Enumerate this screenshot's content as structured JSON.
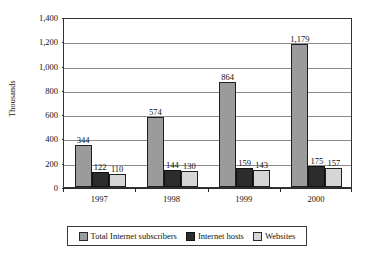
{
  "chart_data": {
    "type": "bar",
    "title": "",
    "subtitle": "",
    "xlabel": "",
    "ylabel": "Thousands",
    "categories": [
      "1997",
      "1998",
      "1999",
      "2000"
    ],
    "series": [
      {
        "name": "Total Internet subscribers",
        "color": "#9b9b9b",
        "values": [
          344,
          574,
          864,
          1179
        ]
      },
      {
        "name": "Internet hosts",
        "color": "#2c2c2c",
        "values": [
          122,
          144,
          159,
          175
        ]
      },
      {
        "name": "Websites",
        "color": "#d6d6d6",
        "values": [
          110,
          130,
          143,
          157
        ]
      }
    ],
    "ylim": [
      0,
      1400
    ],
    "ytick_values": [
      0,
      200,
      400,
      600,
      800,
      1000,
      1200,
      1400
    ],
    "ytick_labels": [
      "0",
      "200",
      "400",
      "600",
      "800",
      "1,000",
      "1,200",
      "1,400"
    ],
    "grid": "horizontal",
    "legend_position": "bottom",
    "data_labels": [
      [
        "344",
        "122",
        "110"
      ],
      [
        "574",
        "144",
        "130"
      ],
      [
        "864",
        "159",
        "143"
      ],
      [
        "1,179",
        "175",
        "157"
      ]
    ]
  },
  "axis": {
    "y_title": "Thousands"
  },
  "legend": {
    "items": [
      {
        "label": "Total Internet subscribers"
      },
      {
        "label": "Internet hosts"
      },
      {
        "label": "Websites"
      }
    ]
  }
}
